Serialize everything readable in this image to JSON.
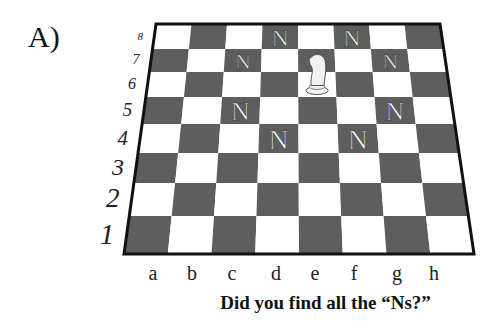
{
  "panel_label": "A)",
  "ranks": [
    "8",
    "7",
    "6",
    "5",
    "4",
    "3",
    "2",
    "1"
  ],
  "files": [
    "a",
    "b",
    "c",
    "d",
    "e",
    "f",
    "g",
    "h"
  ],
  "caption": "Did you find all the “Ns?”",
  "board": {
    "light_color": "#ffffff",
    "dark_color": "#5e5e5e",
    "border_color": "#111111",
    "knight_square": "e6",
    "n_marker_text": "N",
    "n_markers": [
      "d8",
      "f8",
      "c7",
      "g7",
      "c5",
      "g5",
      "d4",
      "f4"
    ]
  }
}
